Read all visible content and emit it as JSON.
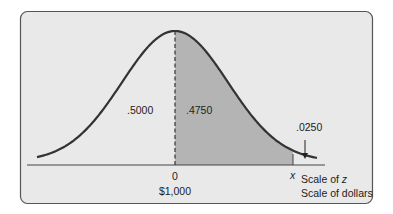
{
  "figure": {
    "type": "normal-distribution-diagram",
    "colors": {
      "panel_bg": "#e9e9e9",
      "panel_border": "#555555",
      "shade": "#b4b4b4",
      "curve": "#333333",
      "text": "#222222"
    },
    "area_labels": {
      "left_half": ".5000",
      "shaded": ".4750",
      "tail": ".0250"
    },
    "axis": {
      "center_z": "0",
      "center_dollars": "$1,000",
      "marker": "x",
      "scale_z_prefix": "Scale of ",
      "scale_z_var": "z",
      "scale_dollars": "Scale of dollars"
    }
  }
}
